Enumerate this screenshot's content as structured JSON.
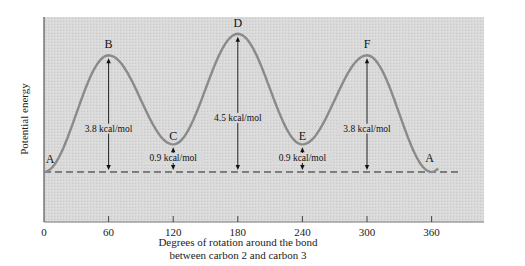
{
  "chart_data": {
    "type": "line",
    "title": "",
    "xlabel": "Degrees of rotation around the bond between carbon 2 and carbon 3",
    "xlabel_lines": [
      "Degrees of rotation around the bond",
      "between carbon 2 and carbon 3"
    ],
    "ylabel": "Potential energy",
    "x_ticks": [
      0,
      60,
      120,
      180,
      240,
      300,
      360
    ],
    "xlim": [
      0,
      408
    ],
    "ylim_kcal": [
      -1.6,
      4.6
    ],
    "grid": false,
    "legend": null,
    "series": [
      {
        "name": "Potential energy",
        "x": [
          0,
          60,
          120,
          180,
          240,
          300,
          360
        ],
        "y": [
          0,
          3.8,
          0.9,
          4.5,
          0.9,
          3.8,
          0
        ],
        "point_labels": [
          "A",
          "B",
          "C",
          "D",
          "E",
          "F",
          "A"
        ]
      }
    ],
    "annotations": [
      {
        "x": 60,
        "from": 0,
        "to": 3.8,
        "label": "3.8 kcal/mol"
      },
      {
        "x": 120,
        "from": 0,
        "to": 0.9,
        "label": "0.9 kcal/mol"
      },
      {
        "x": 180,
        "from": 0,
        "to": 4.5,
        "label": "4.5 kcal/mol"
      },
      {
        "x": 240,
        "from": 0,
        "to": 0.9,
        "label": "0.9 kcal/mol"
      },
      {
        "x": 300,
        "from": 0,
        "to": 3.8,
        "label": "3.8 kcal/mol"
      }
    ],
    "baseline": {
      "y": 0,
      "style": "dashed"
    }
  },
  "colors": {
    "plot_background": "#d6d6d6",
    "curve": "#8a8a8a",
    "axis": "#555555",
    "text": "#111111"
  }
}
